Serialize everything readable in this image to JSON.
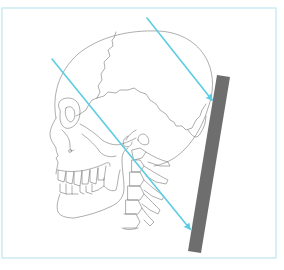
{
  "figure": {
    "type": "anatomical-diagram",
    "width": 284,
    "height": 270,
    "frame": {
      "x": 2,
      "y": 8,
      "w": 274,
      "h": 250,
      "color": "#bfe6ee"
    },
    "colors": {
      "background": "#ffffff",
      "outline": "#6b6b6b",
      "beam": "#5ccde2",
      "detector": "#6e6e6e"
    },
    "beams": [
      {
        "name": "upper-beam",
        "x1": 147,
        "y1": 18,
        "x2": 212,
        "y2": 100
      },
      {
        "name": "lower-beam",
        "x1": 52,
        "y1": 59,
        "x2": 190,
        "y2": 229
      }
    ],
    "detector_plate": {
      "points": "217,75 230,77 201,253 188,251"
    },
    "labels": []
  }
}
